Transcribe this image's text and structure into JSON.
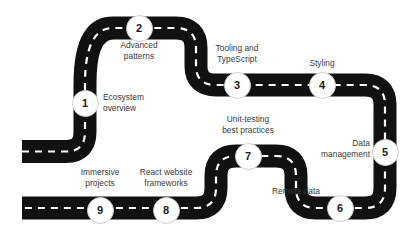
{
  "diagram": {
    "style": {
      "road_color": "#111111",
      "lane_dash_color": "#ffffff",
      "background_color": "#ffffff",
      "label_color": "#3b3b3b",
      "node_fill": "#ffffff",
      "node_border": "#cfcfcf",
      "node_text_color": "#1a1a1a"
    },
    "steps": [
      {
        "number": "1",
        "label": "Ecosystem\noverview",
        "node_x": 85,
        "node_y": 103,
        "label_x": 103,
        "label_y": 92,
        "align": "left"
      },
      {
        "number": "2",
        "label": "Advanced\npatterns",
        "node_x": 139,
        "node_y": 28,
        "label_x": 100,
        "label_y": 40,
        "align": "center"
      },
      {
        "number": "3",
        "label": "Tooling and\nTypeScript",
        "node_x": 237,
        "node_y": 85,
        "label_x": 202,
        "label_y": 43,
        "align": "center"
      },
      {
        "number": "4",
        "label": "Styling",
        "node_x": 322,
        "node_y": 85,
        "label_x": 296,
        "label_y": 58,
        "align": "center"
      },
      {
        "number": "5",
        "label": "Data\nmanagement",
        "node_x": 385,
        "node_y": 152,
        "label_x": 308,
        "label_y": 138,
        "align": "center"
      },
      {
        "number": "6",
        "label": "Remote data",
        "node_x": 340,
        "node_y": 208,
        "label_x": 301,
        "label_y": 186,
        "align": "center"
      },
      {
        "number": "7",
        "label": "Unit-testing\nbest practices",
        "node_x": 248,
        "node_y": 156,
        "label_x": 207,
        "label_y": 114,
        "align": "center"
      },
      {
        "number": "8",
        "label": "React website\nframeworks",
        "node_x": 166,
        "node_y": 210,
        "label_x": 128,
        "label_y": 167,
        "align": "center"
      },
      {
        "number": "9",
        "label": "Immersive\nprojects",
        "node_x": 100,
        "node_y": 210,
        "label_x": 62,
        "label_y": 167,
        "align": "center"
      }
    ]
  }
}
